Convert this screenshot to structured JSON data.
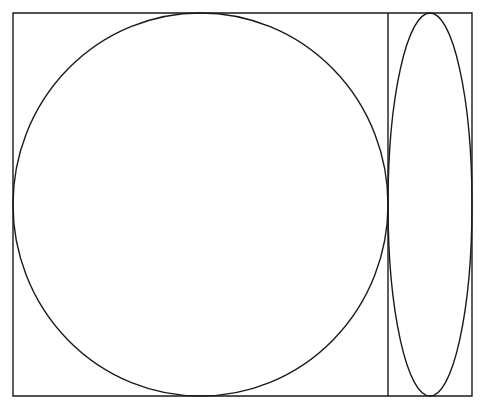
{
  "figure": {
    "background_color": "#ffffff",
    "stroke_color": "#1a1a1a",
    "stroke_width": 1.4,
    "canvas": {
      "width": 486,
      "height": 413
    }
  },
  "geometry": {
    "outer_rectangle": {
      "label": "Outer rectangle",
      "x": 13,
      "y": 13,
      "width": 459,
      "height": 383,
      "left": 13,
      "top": 13,
      "right": 472,
      "bottom": 396
    },
    "divider_line": {
      "label": "Vertical divider",
      "x": 388,
      "y1": 13,
      "y2": 396,
      "orientation": "vertical"
    },
    "left_cell": {
      "label": "Left cell",
      "x": 13,
      "y": 13,
      "width": 375,
      "height": 383
    },
    "right_cell": {
      "label": "Right cell",
      "x": 388,
      "y": 13,
      "width": 84,
      "height": 383
    },
    "large_ellipse": {
      "label": "Large inscribed ellipse",
      "cx": 200.5,
      "cy": 204.5,
      "rx": 187.5,
      "ry": 191.5,
      "aspect_ratio": 0.979
    },
    "narrow_ellipse": {
      "label": "Narrow inscribed ellipse",
      "cx": 430,
      "cy": 204.5,
      "rx": 42,
      "ry": 191.5,
      "aspect_ratio": 0.219
    }
  }
}
